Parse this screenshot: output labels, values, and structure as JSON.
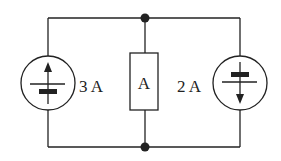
{
  "diagram": {
    "type": "circuit",
    "left_source": {
      "kind": "current-source",
      "value": "3 A",
      "direction": "up"
    },
    "middle_element": {
      "kind": "ammeter",
      "label": "A"
    },
    "right_source": {
      "kind": "current-source",
      "value": "2 A",
      "direction": "down"
    },
    "nodes": [
      "top-junction",
      "bottom-junction"
    ],
    "colors": {
      "stroke": "#222222",
      "background": "#ffffff"
    }
  }
}
